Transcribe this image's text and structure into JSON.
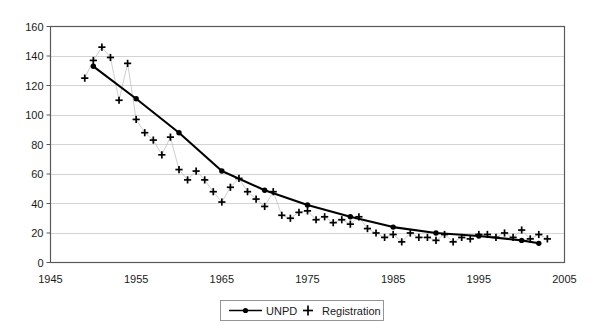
{
  "chart_data": {
    "type": "line",
    "title": "",
    "subtitle": "",
    "xlabel": "",
    "ylabel": "",
    "xlim": [
      1945,
      2005
    ],
    "ylim": [
      0,
      160
    ],
    "xticks": [
      1945,
      1955,
      1965,
      1975,
      1985,
      1995,
      2005
    ],
    "yticks": [
      0,
      20,
      40,
      60,
      80,
      100,
      120,
      140,
      160
    ],
    "grid": "horizontal",
    "legend_position": "bottom-center",
    "legend": [
      {
        "name": "UNPD",
        "marker": "line-with-dot",
        "color": "#000000"
      },
      {
        "name": "Registration",
        "marker": "plus",
        "color": "#000000"
      }
    ],
    "series": [
      {
        "name": "UNPD",
        "marker": "filled-circle",
        "style": "solid-line",
        "points": [
          {
            "x": 1950,
            "y": 133
          },
          {
            "x": 1955,
            "y": 111
          },
          {
            "x": 1960,
            "y": 88
          },
          {
            "x": 1965,
            "y": 62
          },
          {
            "x": 1970,
            "y": 49
          },
          {
            "x": 1975,
            "y": 39
          },
          {
            "x": 1980,
            "y": 31
          },
          {
            "x": 1985,
            "y": 24
          },
          {
            "x": 1990,
            "y": 20
          },
          {
            "x": 1995,
            "y": 18
          },
          {
            "x": 2000,
            "y": 15
          },
          {
            "x": 2002,
            "y": 13
          }
        ]
      },
      {
        "name": "Registration",
        "marker": "plus",
        "style": "markers",
        "points": [
          {
            "x": 1949,
            "y": 125
          },
          {
            "x": 1950,
            "y": 137
          },
          {
            "x": 1951,
            "y": 146
          },
          {
            "x": 1952,
            "y": 139
          },
          {
            "x": 1953,
            "y": 110
          },
          {
            "x": 1954,
            "y": 135
          },
          {
            "x": 1955,
            "y": 97
          },
          {
            "x": 1956,
            "y": 88
          },
          {
            "x": 1957,
            "y": 83
          },
          {
            "x": 1958,
            "y": 73
          },
          {
            "x": 1959,
            "y": 85
          },
          {
            "x": 1960,
            "y": 63
          },
          {
            "x": 1961,
            "y": 56
          },
          {
            "x": 1962,
            "y": 62
          },
          {
            "x": 1963,
            "y": 56
          },
          {
            "x": 1964,
            "y": 48
          },
          {
            "x": 1965,
            "y": 41
          },
          {
            "x": 1966,
            "y": 51
          },
          {
            "x": 1967,
            "y": 57
          },
          {
            "x": 1968,
            "y": 48
          },
          {
            "x": 1969,
            "y": 43
          },
          {
            "x": 1970,
            "y": 38
          },
          {
            "x": 1971,
            "y": 48
          },
          {
            "x": 1972,
            "y": 32
          },
          {
            "x": 1973,
            "y": 30
          },
          {
            "x": 1974,
            "y": 34
          },
          {
            "x": 1975,
            "y": 35
          },
          {
            "x": 1976,
            "y": 29
          },
          {
            "x": 1977,
            "y": 31
          },
          {
            "x": 1978,
            "y": 27
          },
          {
            "x": 1979,
            "y": 29
          },
          {
            "x": 1980,
            "y": 26
          },
          {
            "x": 1981,
            "y": 31
          },
          {
            "x": 1982,
            "y": 23
          },
          {
            "x": 1983,
            "y": 20
          },
          {
            "x": 1984,
            "y": 17
          },
          {
            "x": 1985,
            "y": 19
          },
          {
            "x": 1986,
            "y": 14
          },
          {
            "x": 1987,
            "y": 20
          },
          {
            "x": 1988,
            "y": 17
          },
          {
            "x": 1989,
            "y": 17
          },
          {
            "x": 1990,
            "y": 15
          },
          {
            "x": 1991,
            "y": 19
          },
          {
            "x": 1992,
            "y": 14
          },
          {
            "x": 1993,
            "y": 17
          },
          {
            "x": 1994,
            "y": 16
          },
          {
            "x": 1995,
            "y": 19
          },
          {
            "x": 1996,
            "y": 19
          },
          {
            "x": 1997,
            "y": 17
          },
          {
            "x": 1998,
            "y": 20
          },
          {
            "x": 1999,
            "y": 17
          },
          {
            "x": 2000,
            "y": 22
          },
          {
            "x": 2001,
            "y": 16
          },
          {
            "x": 2002,
            "y": 19
          },
          {
            "x": 2003,
            "y": 16
          }
        ]
      }
    ]
  },
  "colors": {
    "axis": "#595959",
    "grid": "#c9c9c9",
    "unpd": "#000000",
    "registration": "#000000",
    "background": "#ffffff"
  }
}
